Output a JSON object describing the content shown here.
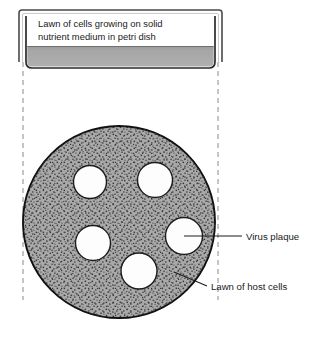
{
  "figure": {
    "name": "petri-dish-plaque-assay",
    "background_color": "#ffffff",
    "width": 324,
    "height": 340
  },
  "cross_section": {
    "name": "petri-dish-cross-section",
    "caption_line1": "Lawn of cells growing on solid",
    "caption_line2": "nutrient medium in petri dish",
    "lid_color": "#ffffff",
    "lid_outline_color": "#3b3b3b",
    "dish_outline_color": "#2b2b2b",
    "medium_color": "#a8a8a8",
    "medium_label": "solid nutrient medium"
  },
  "projection": {
    "name": "projection-guides",
    "style": "dashed",
    "color": "#8a8a8a",
    "left_x": 23,
    "right_x": 218
  },
  "top_view": {
    "name": "petri-dish-top-view",
    "lawn_fill_color": "#a9a9a9",
    "lawn_stipple_color": "#3a3a3a",
    "lawn_outline_color": "#111111",
    "plaque_fill_color": "#fdfdfd",
    "plaque_outline_color": "#1c1c1c",
    "center_x": 119,
    "center_y": 222,
    "radius": 96,
    "plaques": [
      {
        "id": "plaque-top-left",
        "cx": 90,
        "cy": 182,
        "r": 16.5
      },
      {
        "id": "plaque-top-right",
        "cx": 155,
        "cy": 180,
        "r": 17.5
      },
      {
        "id": "plaque-mid-left",
        "cx": 93,
        "cy": 243,
        "r": 17.5
      },
      {
        "id": "plaque-bottom-center",
        "cx": 139,
        "cy": 271,
        "r": 18.0
      },
      {
        "id": "plaque-right",
        "cx": 184,
        "cy": 236,
        "r": 18.5
      }
    ],
    "plaque_count": 5
  },
  "labels": [
    {
      "id": "label-virus-plaque",
      "text": "Virus plaque",
      "text_x": 246,
      "text_y": 239,
      "leader_from_x": 184,
      "leader_from_y": 236,
      "leader_to_x": 242,
      "leader_to_y": 236,
      "target": "plaque-right"
    },
    {
      "id": "label-lawn-of-host-cells",
      "text": "Lawn of host cells",
      "text_x": 211,
      "text_y": 289,
      "leader_from_x": 174,
      "leader_from_y": 272,
      "leader_to_x": 207,
      "leader_to_y": 286,
      "target": "lawn"
    }
  ]
}
